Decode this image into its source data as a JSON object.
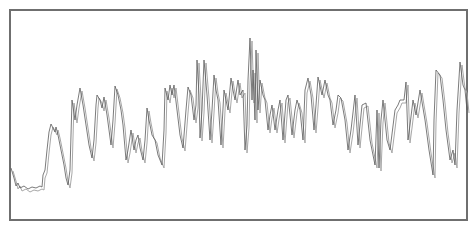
{
  "chart_data": {
    "type": "line",
    "title": "",
    "xlabel": "",
    "ylabel": "",
    "grid": false,
    "legend": null,
    "axes_visible": false,
    "note": "Unlabeled signal trace; values are pixel-space estimates (x: 10-467 px, y: 0 = top of frame at 10px, larger = lower). Two overlapping traces, nearly identical.",
    "xlim": [
      10,
      467
    ],
    "ylim": [
      10,
      220
    ],
    "series": [
      {
        "name": "trace-primary",
        "color": "#5a5a5a",
        "points": [
          [
            11,
            168
          ],
          [
            14,
            178
          ],
          [
            16,
            186
          ],
          [
            18,
            183
          ],
          [
            20,
            188
          ],
          [
            24,
            186
          ],
          [
            28,
            189
          ],
          [
            32,
            187
          ],
          [
            36,
            188
          ],
          [
            40,
            186
          ],
          [
            42,
            187
          ],
          [
            43,
            175
          ],
          [
            45,
            170
          ],
          [
            47,
            150
          ],
          [
            49,
            132
          ],
          [
            51,
            124
          ],
          [
            53,
            128
          ],
          [
            55,
            132
          ],
          [
            56,
            127
          ],
          [
            58,
            135
          ],
          [
            61,
            150
          ],
          [
            64,
            165
          ],
          [
            66,
            178
          ],
          [
            68,
            185
          ],
          [
            70,
            170
          ],
          [
            72,
            100
          ],
          [
            75,
            120
          ],
          [
            77,
            105
          ],
          [
            80,
            88
          ],
          [
            83,
            105
          ],
          [
            86,
            125
          ],
          [
            89,
            145
          ],
          [
            92,
            158
          ],
          [
            94,
            140
          ],
          [
            96,
            105
          ],
          [
            97,
            95
          ],
          [
            100,
            100
          ],
          [
            102,
            108
          ],
          [
            104,
            97
          ],
          [
            107,
            115
          ],
          [
            109,
            130
          ],
          [
            111,
            145
          ],
          [
            113,
            120
          ],
          [
            115,
            86
          ],
          [
            118,
            95
          ],
          [
            121,
            110
          ],
          [
            123,
            125
          ],
          [
            126,
            160
          ],
          [
            128,
            150
          ],
          [
            131,
            130
          ],
          [
            134,
            150
          ],
          [
            136,
            140
          ],
          [
            138,
            135
          ],
          [
            140,
            148
          ],
          [
            143,
            160
          ],
          [
            145,
            140
          ],
          [
            147,
            108
          ],
          [
            149,
            120
          ],
          [
            152,
            135
          ],
          [
            155,
            140
          ],
          [
            158,
            155
          ],
          [
            162,
            165
          ],
          [
            164,
            130
          ],
          [
            165,
            88
          ],
          [
            168,
            100
          ],
          [
            170,
            85
          ],
          [
            172,
            95
          ],
          [
            174,
            85
          ],
          [
            177,
            110
          ],
          [
            180,
            135
          ],
          [
            183,
            148
          ],
          [
            186,
            110
          ],
          [
            188,
            87
          ],
          [
            191,
            95
          ],
          [
            194,
            120
          ],
          [
            196,
            105
          ],
          [
            197,
            60
          ],
          [
            199,
            95
          ],
          [
            200,
            138
          ],
          [
            202,
            110
          ],
          [
            204,
            60
          ],
          [
            207,
            95
          ],
          [
            210,
            140
          ],
          [
            212,
            110
          ],
          [
            214,
            75
          ],
          [
            216,
            90
          ],
          [
            218,
            100
          ],
          [
            221,
            145
          ],
          [
            224,
            90
          ],
          [
            228,
            110
          ],
          [
            231,
            78
          ],
          [
            233,
            90
          ],
          [
            235,
            100
          ],
          [
            238,
            80
          ],
          [
            240,
            95
          ],
          [
            243,
            90
          ],
          [
            245,
            150
          ],
          [
            247,
            125
          ],
          [
            248,
            80
          ],
          [
            250,
            38
          ],
          [
            252,
            100
          ],
          [
            253,
            70
          ],
          [
            255,
            120
          ],
          [
            256,
            50
          ],
          [
            258,
            110
          ],
          [
            260,
            80
          ],
          [
            263,
            95
          ],
          [
            265,
            100
          ],
          [
            268,
            130
          ],
          [
            270,
            115
          ],
          [
            272,
            105
          ],
          [
            275,
            130
          ],
          [
            278,
            110
          ],
          [
            280,
            100
          ],
          [
            283,
            140
          ],
          [
            286,
            100
          ],
          [
            288,
            95
          ],
          [
            292,
            135
          ],
          [
            295,
            110
          ],
          [
            297,
            100
          ],
          [
            300,
            110
          ],
          [
            303,
            140
          ],
          [
            305,
            90
          ],
          [
            308,
            78
          ],
          [
            311,
            95
          ],
          [
            314,
            130
          ],
          [
            316,
            105
          ],
          [
            318,
            77
          ],
          [
            322,
            95
          ],
          [
            325,
            80
          ],
          [
            328,
            95
          ],
          [
            330,
            100
          ],
          [
            333,
            125
          ],
          [
            336,
            110
          ],
          [
            338,
            95
          ],
          [
            341,
            98
          ],
          [
            345,
            120
          ],
          [
            348,
            150
          ],
          [
            351,
            130
          ],
          [
            355,
            95
          ],
          [
            358,
            145
          ],
          [
            362,
            105
          ],
          [
            366,
            103
          ],
          [
            370,
            140
          ],
          [
            375,
            165
          ],
          [
            377,
            110
          ],
          [
            379,
            168
          ],
          [
            381,
            120
          ],
          [
            383,
            100
          ],
          [
            387,
            140
          ],
          [
            390,
            150
          ],
          [
            395,
            110
          ],
          [
            398,
            105
          ],
          [
            400,
            100
          ],
          [
            404,
            100
          ],
          [
            406,
            82
          ],
          [
            408,
            140
          ],
          [
            410,
            125
          ],
          [
            413,
            100
          ],
          [
            416,
            115
          ],
          [
            420,
            90
          ],
          [
            425,
            120
          ],
          [
            429,
            150
          ],
          [
            433,
            175
          ],
          [
            434,
            120
          ],
          [
            436,
            70
          ],
          [
            440,
            75
          ],
          [
            443,
            100
          ],
          [
            446,
            130
          ],
          [
            450,
            160
          ],
          [
            453,
            150
          ],
          [
            455,
            165
          ],
          [
            457,
            110
          ],
          [
            460,
            62
          ],
          [
            463,
            85
          ],
          [
            465,
            90
          ],
          [
            467,
            110
          ]
        ]
      },
      {
        "name": "trace-secondary",
        "color": "#a8a8a8",
        "offset_x_px": 2,
        "offset_y_px": 3
      }
    ]
  },
  "frame": {
    "x": 10,
    "y": 10,
    "width": 457,
    "height": 210,
    "border_color": "#6f6f6f",
    "background": "#ffffff"
  }
}
